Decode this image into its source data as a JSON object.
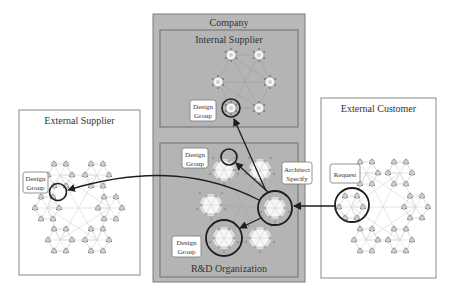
{
  "company": {
    "title": "Company",
    "internal_supplier": {
      "title": "Internal Supplier",
      "design_group_label": [
        "Design",
        "Group"
      ]
    },
    "rd_organization": {
      "title": "R&D Organization",
      "design_group_upper_label": [
        "Design",
        "Group"
      ],
      "design_group_lower_label": [
        "Design",
        "Group"
      ],
      "architect_label": [
        "Architect",
        "Specify"
      ]
    }
  },
  "external_supplier": {
    "title": "External Supplier",
    "design_group_label": [
      "Design",
      "Group"
    ]
  },
  "external_customer": {
    "title": "External Customer",
    "request_label": "Request"
  },
  "colors": {
    "company_fill": "#b8b8b8",
    "company_border": "#7a7a7a",
    "panel_border": "#8a8a8a",
    "node_fill": "#f4f4f4",
    "node_stroke": "#888888",
    "edge": "#c8c8c8",
    "arrow": "#1e1e1e"
  }
}
